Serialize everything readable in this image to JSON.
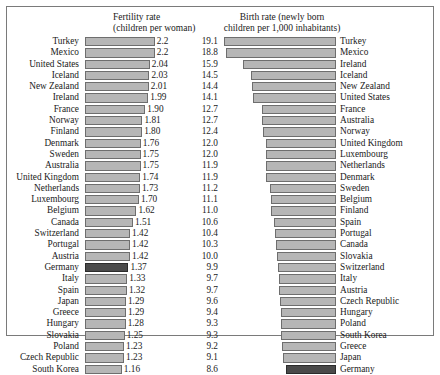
{
  "headers": {
    "left": "Fertility rate\n(children per woman)",
    "right": "Birth rate (newly born\nchildren per 1,000 inhabitants)"
  },
  "colors": {
    "bar_fill": "#b6b6b6",
    "bar_border": "#6e6e6e",
    "highlight_fill": "#4a4a4a",
    "highlight_border": "#2b2b2b",
    "frame": "#7a7a7a",
    "text": "#1a1a1a",
    "background": "#ffffff"
  },
  "highlight_country": "Germany",
  "caption": "",
  "chart_data": {
    "type": "bar",
    "orientation": "horizontal",
    "grid": false,
    "legend": "none",
    "panels": [
      {
        "name": "fertility",
        "title": "Fertility rate",
        "subtitle": "(children per woman)",
        "xlabel": "children per woman",
        "ylabel": "",
        "xlim": [
          0,
          2.3
        ],
        "anchor": "left",
        "categories": [
          "Turkey",
          "Mexico",
          "United States",
          "Iceland",
          "New Zealand",
          "Ireland",
          "France",
          "Norway",
          "Finland",
          "Denmark",
          "Sweden",
          "Australia",
          "United Kingdom",
          "Netherlands",
          "Luxembourg",
          "Belgium",
          "Canada",
          "Switzerland",
          "Portugal",
          "Austria",
          "Germany",
          "Italy",
          "Spain",
          "Japan",
          "Greece",
          "Hungary",
          "Slovakia",
          "Poland",
          "Czech Republic",
          "South Korea"
        ],
        "values": [
          2.2,
          2.2,
          2.04,
          2.03,
          2.01,
          1.99,
          1.9,
          1.81,
          1.8,
          1.76,
          1.75,
          1.75,
          1.74,
          1.73,
          1.7,
          1.62,
          1.51,
          1.42,
          1.42,
          1.42,
          1.37,
          1.33,
          1.32,
          1.29,
          1.29,
          1.28,
          1.25,
          1.23,
          1.23,
          1.16
        ],
        "labels": [
          "2.2",
          "2.2",
          "2.04",
          "2.03",
          "2.01",
          "1.99",
          "1.90",
          "1.81",
          "1.80",
          "1.76",
          "1.75",
          "1.75",
          "1.74",
          "1.73",
          "1.70",
          "1.62",
          "1.51",
          "1.42",
          "1.42",
          "1.42",
          "1.37",
          "1.33",
          "1.32",
          "1.29",
          "1.29",
          "1.28",
          "1.25",
          "1.23",
          "1.23",
          "1.16"
        ]
      },
      {
        "name": "birth_rate",
        "title": "Birth rate (newly born",
        "subtitle": "children per 1,000 inhabitants)",
        "xlabel": "newly born children per 1,000 inhabitants",
        "ylabel": "",
        "xlim": [
          0,
          19.6
        ],
        "anchor": "right",
        "categories": [
          "Turkey",
          "Mexico",
          "Ireland",
          "Iceland",
          "New Zealand",
          "United States",
          "France",
          "Australia",
          "Norway",
          "United Kingdom",
          "Luxembourg",
          "Netherlands",
          "Denmark",
          "Sweden",
          "Belgium",
          "Finland",
          "Spain",
          "Portugal",
          "Canada",
          "Slovakia",
          "Switzerland",
          "Italy",
          "Austria",
          "Czech Republic",
          "Hungary",
          "Poland",
          "South Korea",
          "Greece",
          "Japan",
          "Germany"
        ],
        "values": [
          19.1,
          18.8,
          15.9,
          14.5,
          14.4,
          14.1,
          12.7,
          12.7,
          12.4,
          12.0,
          12.0,
          11.9,
          11.9,
          11.2,
          11.1,
          11.0,
          10.6,
          10.4,
          10.3,
          10.0,
          9.9,
          9.7,
          9.7,
          9.6,
          9.4,
          9.3,
          9.3,
          9.2,
          9.1,
          8.6
        ],
        "labels": [
          "19.1",
          "18.8",
          "15.9",
          "14.5",
          "14.4",
          "14.1",
          "12.7",
          "12.7",
          "12.4",
          "12.0",
          "12.0",
          "11.9",
          "11.9",
          "11.2",
          "11.1",
          "11.0",
          "10.6",
          "10.4",
          "10.3",
          "10.0",
          "9.9",
          "9.7",
          "9.7",
          "9.6",
          "9.4",
          "9.3",
          "9.3",
          "9.2",
          "9.1",
          "8.6"
        ]
      }
    ]
  }
}
